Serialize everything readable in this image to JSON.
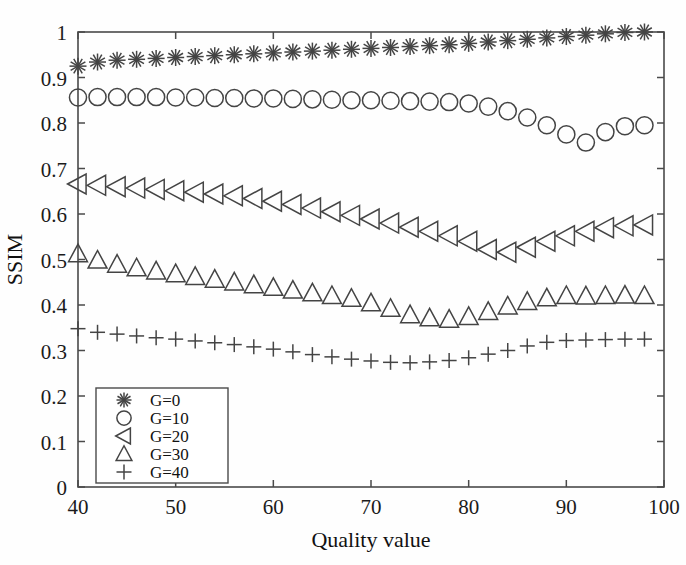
{
  "figure": {
    "background": "#ffffff",
    "marker_color": "#444444",
    "axis_color": "#4a4a4a"
  },
  "chart_data": {
    "type": "scatter",
    "title": "",
    "xlabel": "Quality value",
    "ylabel": "SSIM",
    "xlim": [
      40,
      100
    ],
    "ylim": [
      0,
      1
    ],
    "xticks": [
      40,
      50,
      60,
      70,
      80,
      90,
      100
    ],
    "xticklabels": [
      "40",
      "50",
      "60",
      "70",
      "80",
      "90",
      "100"
    ],
    "yticks": [
      0,
      0.1,
      0.2,
      0.3,
      0.4,
      0.5,
      0.6,
      0.7,
      0.8,
      0.9,
      1
    ],
    "yticklabels": [
      "0",
      "0.1",
      "0.2",
      "0.3",
      "0.4",
      "0.5",
      "0.6",
      "0.7",
      "0.8",
      "0.9",
      "1"
    ],
    "grid": false,
    "legend_position": "lower left",
    "x": [
      40,
      42,
      44,
      46,
      48,
      50,
      52,
      54,
      56,
      58,
      60,
      62,
      64,
      66,
      68,
      70,
      72,
      74,
      76,
      78,
      80,
      82,
      84,
      86,
      88,
      90,
      92,
      94,
      96,
      98
    ],
    "series": [
      {
        "name": "G=0",
        "marker": "asterisk",
        "values": [
          0.925,
          0.934,
          0.938,
          0.94,
          0.942,
          0.944,
          0.946,
          0.948,
          0.95,
          0.952,
          0.954,
          0.956,
          0.958,
          0.96,
          0.962,
          0.964,
          0.966,
          0.968,
          0.97,
          0.972,
          0.975,
          0.978,
          0.981,
          0.984,
          0.987,
          0.99,
          0.993,
          0.996,
          0.999,
          1.0
        ]
      },
      {
        "name": "G=10",
        "marker": "circle",
        "values": [
          0.856,
          0.857,
          0.857,
          0.857,
          0.857,
          0.856,
          0.856,
          0.855,
          0.855,
          0.854,
          0.854,
          0.853,
          0.852,
          0.851,
          0.85,
          0.85,
          0.849,
          0.848,
          0.847,
          0.846,
          0.843,
          0.836,
          0.826,
          0.812,
          0.795,
          0.775,
          0.757,
          0.78,
          0.793,
          0.795
        ]
      },
      {
        "name": "G=20",
        "marker": "left-triangle",
        "values": [
          0.666,
          0.663,
          0.66,
          0.657,
          0.654,
          0.651,
          0.648,
          0.644,
          0.64,
          0.634,
          0.628,
          0.621,
          0.613,
          0.605,
          0.597,
          0.589,
          0.58,
          0.571,
          0.562,
          0.552,
          0.54,
          0.522,
          0.516,
          0.527,
          0.54,
          0.552,
          0.562,
          0.57,
          0.574,
          0.576
        ]
      },
      {
        "name": "G=30",
        "marker": "triangle",
        "values": [
          0.512,
          0.498,
          0.489,
          0.481,
          0.474,
          0.468,
          0.462,
          0.456,
          0.45,
          0.444,
          0.438,
          0.432,
          0.426,
          0.42,
          0.414,
          0.404,
          0.392,
          0.378,
          0.371,
          0.368,
          0.374,
          0.385,
          0.397,
          0.407,
          0.415,
          0.42,
          0.419,
          0.42,
          0.421,
          0.42
        ]
      },
      {
        "name": "G=40",
        "marker": "plus",
        "values": [
          0.348,
          0.34,
          0.336,
          0.332,
          0.328,
          0.325,
          0.321,
          0.317,
          0.313,
          0.308,
          0.303,
          0.297,
          0.291,
          0.286,
          0.281,
          0.277,
          0.274,
          0.273,
          0.275,
          0.278,
          0.284,
          0.292,
          0.3,
          0.31,
          0.318,
          0.322,
          0.323,
          0.324,
          0.325,
          0.325
        ]
      }
    ]
  },
  "legend": {
    "items": [
      {
        "label": "G=0",
        "marker": "asterisk"
      },
      {
        "label": "G=10",
        "marker": "circle"
      },
      {
        "label": "G=20",
        "marker": "left-triangle"
      },
      {
        "label": "G=30",
        "marker": "triangle"
      },
      {
        "label": "G=40",
        "marker": "plus"
      }
    ]
  }
}
